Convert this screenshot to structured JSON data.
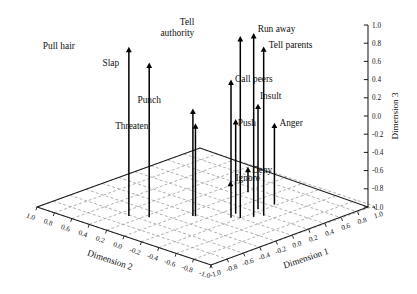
{
  "chart_data": {
    "type": "scatter",
    "title": "",
    "projection": "3d",
    "xlabel": "Dimension 1",
    "ylabel": "Dimension 2",
    "zlabel": "Dimension 3",
    "xlim": [
      -1.0,
      1.0
    ],
    "ylim": [
      -1.0,
      1.0
    ],
    "zlim": [
      -1.0,
      1.0
    ],
    "grid": true,
    "legend": "none",
    "axes": {
      "dimension_1": {
        "label": "Dimension 1",
        "ticks": [
          "-1.0",
          "-0.8",
          "-0.6",
          "-0.4",
          "-0.2",
          "0.0",
          "0.2",
          "0.4",
          "0.6",
          "0.8",
          "1.0"
        ],
        "values": [
          -1.0,
          -0.8,
          -0.6,
          -0.4,
          -0.2,
          0.0,
          0.2,
          0.4,
          0.6,
          0.8,
          1.0
        ]
      },
      "dimension_2": {
        "label": "Dimension 2",
        "ticks": [
          "1.0",
          "0.8",
          "0.6",
          "0.4",
          "0.2",
          "0.0",
          "-0.2",
          "-0.4",
          "-0.6",
          "-0.8",
          "-1.0"
        ],
        "values": [
          1.0,
          0.8,
          0.6,
          0.4,
          0.2,
          0.0,
          -0.2,
          -0.4,
          -0.6,
          -0.8,
          -1.0
        ]
      },
      "dimension_3": {
        "label": "Dimension 3",
        "ticks": [
          "1.0",
          "0.8",
          "0.6",
          "0.4",
          "0.2",
          "0.0",
          "-0.2",
          "-0.4",
          "-0.6",
          "-0.8",
          "-1.0"
        ],
        "values": [
          1.0,
          0.8,
          0.6,
          0.4,
          0.2,
          0.0,
          -0.2,
          -0.4,
          -0.6,
          -0.8,
          -1.0
        ]
      }
    },
    "points": [
      {
        "label": "Pull hair",
        "x": -0.62,
        "y": 0.3,
        "z": 0.86,
        "label_dx": -54,
        "label_dy": 2
      },
      {
        "label": "Slap",
        "x": -0.52,
        "y": 0.16,
        "z": 0.7,
        "label_dx": -30,
        "label_dy": 3
      },
      {
        "label": "Punch",
        "x": -0.24,
        "y": -0.08,
        "z": 0.18,
        "label_dx": -32,
        "label_dy": -6
      },
      {
        "label": "Threaten",
        "x": -0.23,
        "y": -0.1,
        "z": 0.02,
        "label_dx": -47,
        "label_dy": 6
      },
      {
        "label": "Tell authority",
        "x": 0.0,
        "y": -0.4,
        "z": 1.0,
        "label_dx": -46,
        "label_dy": -1
      },
      {
        "label": "Call peers",
        "x": -0.05,
        "y": -0.34,
        "z": 0.52,
        "label_dx": 4,
        "label_dy": 2
      },
      {
        "label": "Run away",
        "x": 0.1,
        "y": -0.46,
        "z": 1.02,
        "label_dx": 4,
        "label_dy": -1
      },
      {
        "label": "Tell parents",
        "x": 0.18,
        "y": -0.5,
        "z": 0.86,
        "label_dx": 5,
        "label_dy": 2
      },
      {
        "label": "Push",
        "x": 0.05,
        "y": -0.3,
        "z": 0.04,
        "label_dx": 2,
        "label_dy": 7
      },
      {
        "label": "Insult",
        "x": 0.26,
        "y": -0.36,
        "z": 0.16,
        "label_dx": 2,
        "label_dy": -5
      },
      {
        "label": "Anger",
        "x": 0.44,
        "y": -0.38,
        "z": -0.1,
        "label_dx": 5,
        "label_dy": 3
      },
      {
        "label": "Ignore",
        "x": 0.52,
        "y": 0.2,
        "z": -0.95,
        "label_dx": 5,
        "label_dy": 0
      },
      {
        "label": "Deny",
        "x": 0.5,
        "y": -0.02,
        "z": -0.72,
        "label_dx": 4,
        "label_dy": 6
      }
    ]
  },
  "style": {
    "background": "#ffffff",
    "axis_color": "#1a1a1a",
    "grid_color": "#9a9a9a",
    "marker_color": "#000000"
  }
}
